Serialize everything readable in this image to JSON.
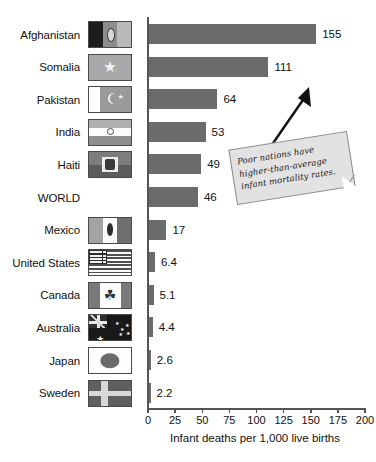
{
  "chart_data": {
    "type": "bar",
    "orientation": "horizontal",
    "title": "",
    "xlabel": "Infant deaths per 1,000 live births",
    "ylabel": "",
    "xlim": [
      0,
      200
    ],
    "xticks": [
      0,
      25,
      50,
      75,
      100,
      125,
      150,
      175,
      200
    ],
    "xtick_labels": [
      "0",
      "25",
      "50",
      "75",
      "100",
      "125",
      "150",
      "175",
      "200"
    ],
    "grid": false,
    "legend": null,
    "bar_color": "#6b6b6b",
    "categories": [
      "Afghanistan",
      "Somalia",
      "Pakistan",
      "India",
      "Haiti",
      "WORLD",
      "Mexico",
      "United States",
      "Canada",
      "Australia",
      "Japan",
      "Sweden"
    ],
    "values": [
      155,
      111,
      64,
      53,
      49,
      46,
      17,
      6.4,
      5.1,
      4.4,
      2.6,
      2.2
    ],
    "value_labels": [
      "155",
      "111",
      "64",
      "53",
      "49",
      "46",
      "17",
      "6.4",
      "5.1",
      "4.4",
      "2.6",
      "2.2"
    ],
    "annotations": [
      {
        "text": "Poor nations have higher-than-average infant mortality rates.",
        "style": "sticky-note-callout-with-arrow"
      }
    ]
  },
  "rows": [
    {
      "label": "Afghanistan",
      "value": 155,
      "value_label": "155",
      "flag": "flag-afghanistan",
      "has_flag": true
    },
    {
      "label": "Somalia",
      "value": 111,
      "value_label": "111",
      "flag": "flag-somalia",
      "has_flag": true
    },
    {
      "label": "Pakistan",
      "value": 64,
      "value_label": "64",
      "flag": "flag-pakistan",
      "has_flag": true
    },
    {
      "label": "India",
      "value": 53,
      "value_label": "53",
      "flag": "flag-india",
      "has_flag": true
    },
    {
      "label": "Haiti",
      "value": 49,
      "value_label": "49",
      "flag": "flag-haiti",
      "has_flag": true
    },
    {
      "label": "WORLD",
      "value": 46,
      "value_label": "46",
      "flag": null,
      "has_flag": false
    },
    {
      "label": "Mexico",
      "value": 17,
      "value_label": "17",
      "flag": "flag-mexico",
      "has_flag": true
    },
    {
      "label": "United States",
      "value": 6.4,
      "value_label": "6.4",
      "flag": "flag-united-states",
      "has_flag": true
    },
    {
      "label": "Canada",
      "value": 5.1,
      "value_label": "5.1",
      "flag": "flag-canada",
      "has_flag": true
    },
    {
      "label": "Australia",
      "value": 4.4,
      "value_label": "4.4",
      "flag": "flag-australia",
      "has_flag": true
    },
    {
      "label": "Japan",
      "value": 2.6,
      "value_label": "2.6",
      "flag": "flag-japan",
      "has_flag": true
    },
    {
      "label": "Sweden",
      "value": 2.2,
      "value_label": "2.2",
      "flag": "flag-sweden",
      "has_flag": true
    }
  ],
  "axis": {
    "x_title": "Infant deaths per 1,000 live births",
    "ticks": [
      "0",
      "25",
      "50",
      "75",
      "100",
      "125",
      "150",
      "175",
      "200"
    ]
  },
  "callout": {
    "line1": "Poor nations have",
    "line2": "higher-than-average",
    "line3": "infant mortality rates.",
    "text": "Poor nations have higher-than-average infant mortality rates."
  }
}
